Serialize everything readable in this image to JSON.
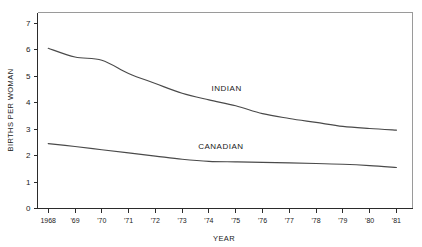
{
  "chart_data": {
    "type": "line",
    "title": "",
    "xlabel": "YEAR",
    "ylabel": "BIRTHS PER WOMAN",
    "x": [
      1968,
      1969,
      1970,
      1971,
      1972,
      1973,
      1974,
      1975,
      1976,
      1977,
      1978,
      1979,
      1980,
      1981
    ],
    "xtick_labels": [
      "1968",
      "'69",
      "'70",
      "'71",
      "'72",
      "'73",
      "'74",
      "'75",
      "'76",
      "'77",
      "'78",
      "'79",
      "'80",
      "'81"
    ],
    "ytick_labels": [
      "0",
      "1",
      "2",
      "3",
      "4",
      "5",
      "6",
      "7"
    ],
    "ytick_values": [
      0,
      1,
      2,
      3,
      4,
      5,
      6,
      7
    ],
    "ylim": [
      0,
      7.4
    ],
    "xlim": [
      1967.6,
      1981.6
    ],
    "grid": false,
    "legend_position": "inline-annotation",
    "series": [
      {
        "name": "INDIAN",
        "label": "INDIAN",
        "color": "#4a4a4a",
        "label_x": 1974.1,
        "label_y": 4.45,
        "values": [
          6.05,
          5.72,
          5.6,
          5.1,
          4.72,
          4.35,
          4.1,
          3.88,
          3.58,
          3.4,
          3.25,
          3.1,
          3.02,
          2.96
        ]
      },
      {
        "name": "CANADIAN",
        "label": "CANADIAN",
        "color": "#4a4a4a",
        "label_x": 1973.6,
        "label_y": 2.25,
        "values": [
          2.45,
          2.34,
          2.22,
          2.1,
          1.98,
          1.86,
          1.78,
          1.76,
          1.74,
          1.72,
          1.7,
          1.67,
          1.62,
          1.55
        ]
      }
    ]
  }
}
